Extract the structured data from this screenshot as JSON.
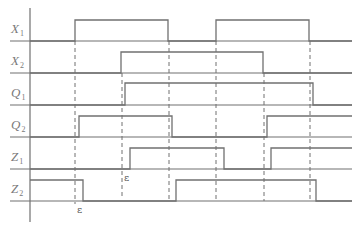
{
  "colors": {
    "background": "#ffffff",
    "line": "#707070",
    "label": "#7a7a7a",
    "annotation": "#555555"
  },
  "diagram": {
    "type": "timing-diagram",
    "axis": {
      "x": 30,
      "y_top": 8,
      "y_bottom": 222
    },
    "baseline_x_range": [
      10,
      352
    ],
    "waveform_end_x": 352,
    "signals": [
      {
        "name": "X",
        "sub": "1",
        "label_y": 21,
        "baseline_y": 41,
        "high_y": 20,
        "initial": 0,
        "edges": [
          75,
          168,
          216,
          309
        ]
      },
      {
        "name": "X",
        "sub": "2",
        "label_y": 53,
        "baseline_y": 73,
        "high_y": 52,
        "initial": 0,
        "edges": [
          121,
          263
        ]
      },
      {
        "name": "Q",
        "sub": "1",
        "label_y": 85,
        "baseline_y": 105,
        "high_y": 83,
        "initial": 0,
        "edges": [
          125,
          313
        ]
      },
      {
        "name": "Q",
        "sub": "2",
        "label_y": 117,
        "baseline_y": 137,
        "high_y": 116,
        "initial": 0,
        "edges": [
          79,
          172,
          267
        ]
      },
      {
        "name": "Z",
        "sub": "1",
        "label_y": 149,
        "baseline_y": 169,
        "high_y": 148,
        "initial": 0,
        "edges": [
          130,
          224,
          271
        ]
      },
      {
        "name": "Z",
        "sub": "2",
        "label_y": 181,
        "baseline_y": 201,
        "high_y": 180,
        "initial": 1,
        "edges": [
          83,
          176,
          316
        ]
      }
    ],
    "dashed_lines": [
      {
        "x": 75,
        "y1": 41,
        "y2": 204
      },
      {
        "x": 122,
        "y1": 73,
        "y2": 198
      },
      {
        "x": 169,
        "y1": 41,
        "y2": 201
      },
      {
        "x": 216,
        "y1": 41,
        "y2": 201
      },
      {
        "x": 264,
        "y1": 73,
        "y2": 201
      },
      {
        "x": 310,
        "y1": 41,
        "y2": 201
      }
    ],
    "annotations": [
      {
        "text": "ε",
        "x": 77,
        "y": 213
      },
      {
        "text": "ε",
        "x": 124,
        "y": 181
      }
    ]
  }
}
